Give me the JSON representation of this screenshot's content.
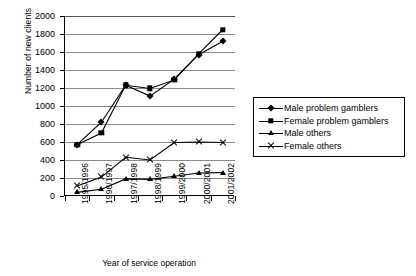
{
  "chart_data": {
    "type": "line",
    "title": "",
    "xlabel": "Year of service operation",
    "ylabel": "Number of new clients",
    "categories": [
      "1995/1996",
      "1996/1997",
      "1997/1998",
      "1998/1999",
      "1999/2000",
      "2000/2001",
      "2001/2002"
    ],
    "ylim": [
      0,
      2000
    ],
    "ytick_step": 200,
    "yticks": [
      0,
      200,
      400,
      600,
      800,
      1000,
      1200,
      1400,
      1600,
      1800,
      2000
    ],
    "ytick_labels": [
      "0",
      "200",
      "400",
      "600",
      "800",
      "1000",
      "1200",
      "1400",
      "1600",
      "1800",
      "2000"
    ],
    "grid": true,
    "grid_axis": "y",
    "legend_position": "right-middle",
    "series": [
      {
        "name": "Male problem gamblers",
        "marker": "diamond",
        "values": [
          570,
          820,
          1230,
          1110,
          1300,
          1570,
          1720
        ]
      },
      {
        "name": "Female problem gamblers",
        "marker": "square",
        "values": [
          570,
          700,
          1230,
          1195,
          1290,
          1580,
          1850
        ]
      },
      {
        "name": "Male others",
        "marker": "triangle",
        "values": [
          40,
          75,
          190,
          185,
          220,
          255,
          260
        ]
      },
      {
        "name": "Female others",
        "marker": "cross",
        "values": [
          110,
          210,
          430,
          400,
          595,
          600,
          595
        ]
      }
    ]
  },
  "legend": {
    "items": [
      {
        "label": "Male problem gamblers",
        "marker": "diamond"
      },
      {
        "label": "Female problem gamblers",
        "marker": "square"
      },
      {
        "label": "Male others",
        "marker": "triangle"
      },
      {
        "label": "Female others",
        "marker": "cross"
      }
    ]
  },
  "colors": {
    "series_line": "#000000",
    "gridline": "#8a8a8a",
    "axis": "#000000",
    "background": "#ffffff"
  }
}
